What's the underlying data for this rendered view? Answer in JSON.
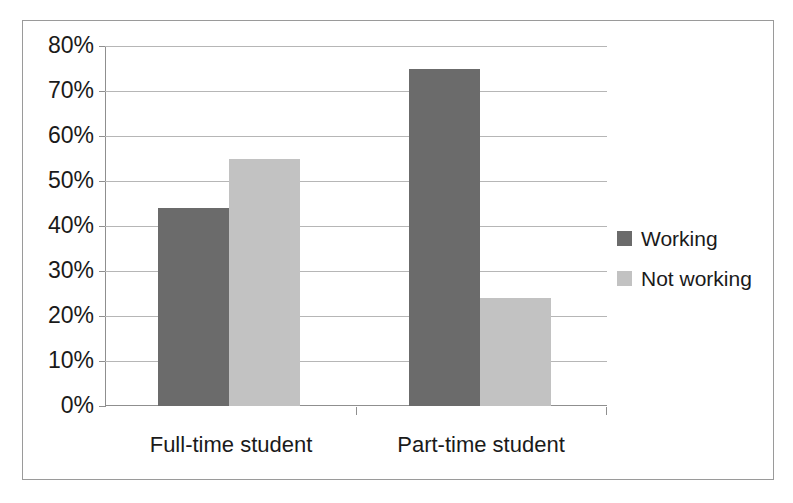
{
  "chart_data": {
    "type": "bar",
    "title": "",
    "subtitle": "",
    "xlabel": "",
    "ylabel": "",
    "categories": [
      "Full-time student",
      "Part-time student"
    ],
    "series": [
      {
        "name": "Working",
        "values": [
          44,
          75
        ],
        "color": "#6b6b6b"
      },
      {
        "name": "Not working",
        "values": [
          55,
          24
        ],
        "color": "#c2c2c2"
      }
    ],
    "ylim": [
      0,
      80
    ],
    "ytick_step": 10,
    "ytick_labels": [
      "0%",
      "10%",
      "20%",
      "30%",
      "40%",
      "50%",
      "60%",
      "70%",
      "80%"
    ],
    "ytick_values": [
      0,
      10,
      20,
      30,
      40,
      50,
      60,
      70,
      80
    ],
    "value_suffix": "%",
    "grid": true,
    "legend_position": "right",
    "legend_entries": [
      "Working",
      "Not working"
    ],
    "border_color": "#9a9a9a",
    "gridline_color": "#b6b6b6",
    "axis_color": "#8f8f8f",
    "text_color": "#1a1a1a",
    "background": "#ffffff"
  }
}
